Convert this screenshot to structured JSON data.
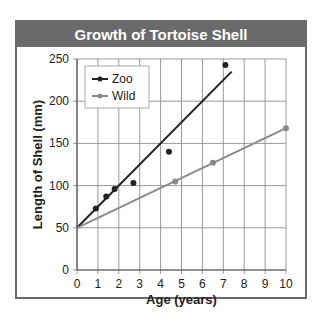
{
  "chart_data": {
    "type": "line",
    "title": "Growth of Tortoise Shell",
    "xlabel": "Age (years)",
    "ylabel": "Length of Shell (mm)",
    "xlim": [
      0,
      10
    ],
    "ylim": [
      0,
      250
    ],
    "x_ticks": [
      0,
      1,
      2,
      3,
      4,
      5,
      6,
      7,
      8,
      9,
      10
    ],
    "y_ticks": [
      0,
      50,
      100,
      150,
      200,
      250
    ],
    "grid": true,
    "legend_position": "upper left",
    "series": [
      {
        "name": "Zoo",
        "color": "#222222",
        "points": [
          [
            0.9,
            73
          ],
          [
            1.4,
            87
          ],
          [
            1.8,
            96
          ],
          [
            2.7,
            103
          ],
          [
            4.4,
            140
          ],
          [
            7.1,
            243
          ]
        ],
        "trend_line": [
          [
            0,
            50
          ],
          [
            7.4,
            235
          ]
        ]
      },
      {
        "name": "Wild",
        "color": "#8a8a8a",
        "points": [
          [
            4.7,
            105
          ],
          [
            6.5,
            127
          ],
          [
            10,
            168
          ]
        ],
        "trend_line": [
          [
            0,
            50
          ],
          [
            10,
            168
          ]
        ]
      }
    ]
  }
}
